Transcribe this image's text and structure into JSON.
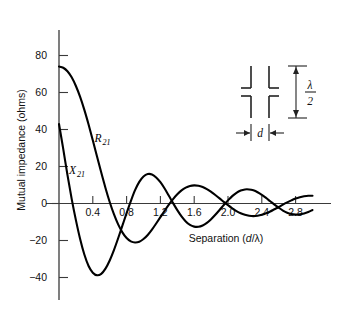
{
  "figure": {
    "background": "#ffffff",
    "curve_color": "#000000",
    "axis_color": "#3a3a3a"
  },
  "chart_data": {
    "type": "line",
    "title": "",
    "xlabel": "Separation (d/λ)",
    "ylabel": "Mutual impedance (ohms)",
    "xlim": [
      -0.05,
      3.1
    ],
    "ylim": [
      -45,
      90
    ],
    "grid": false,
    "legend": "inline-labels",
    "xticks": [
      0.4,
      0.8,
      1.2,
      1.6,
      2.0,
      2.4,
      2.8
    ],
    "xtick_labels": [
      "0.4",
      "0.8",
      "1.2",
      "1.6",
      "2.0",
      "2.4",
      "2.8"
    ],
    "yticks": [
      80,
      60,
      40,
      20,
      0,
      -20,
      -40
    ],
    "ytick_labels": [
      "80",
      "60",
      "40",
      "20",
      "0",
      "−20",
      "−40"
    ],
    "series": [
      {
        "name": "R21",
        "label": "R",
        "label_sub": "21",
        "label_x": 0.42,
        "label_y": 33,
        "x": [
          0.0,
          0.05,
          0.1,
          0.15,
          0.2,
          0.25,
          0.3,
          0.35,
          0.4,
          0.45,
          0.5,
          0.55,
          0.6,
          0.65,
          0.7,
          0.75,
          0.8,
          0.85,
          0.9,
          0.95,
          1.0,
          1.05,
          1.1,
          1.15,
          1.2,
          1.25,
          1.3,
          1.35,
          1.4,
          1.45,
          1.5,
          1.55,
          1.6,
          1.65,
          1.7,
          1.75,
          1.8,
          1.85,
          1.9,
          1.95,
          2.0,
          2.05,
          2.1,
          2.15,
          2.2,
          2.25,
          2.3,
          2.35,
          2.4,
          2.45,
          2.5,
          2.55,
          2.6,
          2.65,
          2.7,
          2.75,
          2.8,
          2.85,
          2.9,
          2.95,
          3.0
        ],
        "y": [
          74,
          73.4,
          71.5,
          68.2,
          63.5,
          57.6,
          50.6,
          42.7,
          34.2,
          25.4,
          16.7,
          8.4,
          0.8,
          -5.8,
          -11.3,
          -15.6,
          -18.7,
          -20.5,
          -21.1,
          -20.7,
          -19.2,
          -17.0,
          -14.1,
          -10.8,
          -7.4,
          -3.9,
          -0.6,
          2.4,
          5.0,
          7.1,
          8.6,
          9.5,
          9.8,
          9.6,
          8.9,
          7.8,
          6.3,
          4.6,
          2.8,
          0.9,
          -0.9,
          -2.6,
          -4.1,
          -5.3,
          -6.1,
          -6.6,
          -6.8,
          -6.6,
          -6.1,
          -5.3,
          -4.3,
          -3.1,
          -1.9,
          -0.6,
          0.6,
          1.7,
          2.7,
          3.4,
          3.9,
          4.2,
          4.2
        ]
      },
      {
        "name": "X21",
        "label": "X",
        "label_sub": "21",
        "label_x": 0.12,
        "label_y": 16,
        "x": [
          0.0,
          0.05,
          0.1,
          0.15,
          0.2,
          0.25,
          0.3,
          0.35,
          0.4,
          0.45,
          0.5,
          0.55,
          0.6,
          0.65,
          0.7,
          0.75,
          0.8,
          0.85,
          0.9,
          0.95,
          1.0,
          1.05,
          1.1,
          1.15,
          1.2,
          1.25,
          1.3,
          1.35,
          1.4,
          1.45,
          1.5,
          1.55,
          1.6,
          1.65,
          1.7,
          1.75,
          1.8,
          1.85,
          1.9,
          1.95,
          2.0,
          2.05,
          2.1,
          2.15,
          2.2,
          2.25,
          2.3,
          2.35,
          2.4,
          2.45,
          2.5,
          2.55,
          2.6,
          2.65,
          2.7,
          2.75,
          2.8,
          2.85,
          2.9,
          2.95,
          3.0
        ],
        "y": [
          43,
          29.5,
          15.5,
          2.5,
          -9.0,
          -19.2,
          -27.6,
          -33.8,
          -37.4,
          -38.8,
          -38.0,
          -35.2,
          -30.8,
          -25.2,
          -18.8,
          -12.0,
          -5.2,
          1.3,
          7.2,
          11.7,
          14.6,
          15.9,
          15.7,
          14.1,
          11.5,
          8.1,
          4.2,
          0.2,
          -3.6,
          -7.0,
          -9.7,
          -11.6,
          -12.5,
          -12.6,
          -11.9,
          -10.5,
          -8.5,
          -6.1,
          -3.5,
          -0.8,
          1.7,
          4.0,
          5.8,
          7.0,
          7.6,
          7.6,
          7.1,
          6.1,
          4.7,
          3.0,
          1.2,
          -0.6,
          -2.3,
          -3.8,
          -5.0,
          -5.7,
          -6.0,
          -5.9,
          -5.4,
          -4.6,
          -3.5
        ]
      }
    ]
  },
  "inset": {
    "name": "dipole-pair-diagram",
    "height_label_numerator": "λ",
    "height_label_denominator": "2",
    "separation_label": "d"
  }
}
